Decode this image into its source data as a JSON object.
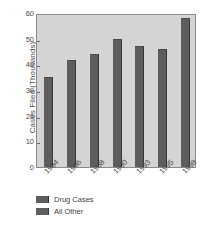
{
  "chart_data": {
    "type": "bar",
    "title": "",
    "xlabel": "",
    "ylabel": "Cases Filed (Thousands)",
    "categories": [
      "1984",
      "1986",
      "1988",
      "1990",
      "1993",
      "1995",
      "1998"
    ],
    "values": [
      35,
      41.5,
      44,
      50,
      47,
      46,
      58
    ],
    "series": [
      {
        "name": "Drug Cases",
        "values": [
          35,
          41.5,
          44,
          50,
          47,
          46,
          58
        ]
      }
    ],
    "ylim": [
      0,
      60
    ],
    "ytick_labels": [
      "0",
      "10",
      "20",
      "30",
      "40",
      "50",
      "60"
    ],
    "ytick_values": [
      0,
      10,
      20,
      30,
      40,
      50,
      60
    ],
    "grid": false,
    "legend_position": "below-left",
    "legend": [
      {
        "label": "Drug Cases",
        "color": "#5d5d5d"
      },
      {
        "label": "All Other",
        "color": "#5d5d5d"
      }
    ],
    "colors": {
      "bar": "#5d5d5d",
      "bar_edge": "#363636",
      "plot_background": "#d4d4d4",
      "page_background": "#ffffff",
      "axis": "#8a8a8a",
      "text": "#4a4a4a"
    }
  }
}
